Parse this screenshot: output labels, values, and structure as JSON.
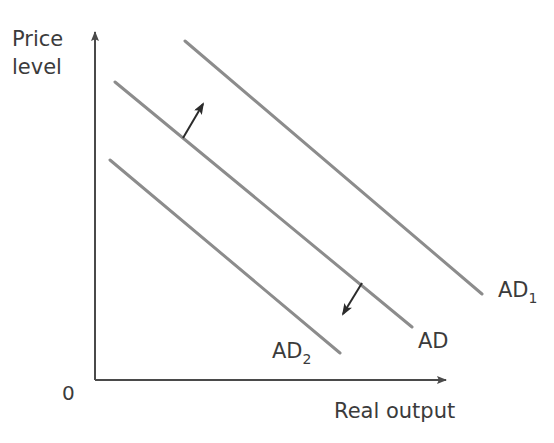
{
  "figure": {
    "background_color": "#ffffff",
    "curve_color": "#8c8c8c",
    "axis_color": "#4a4a4a",
    "text_color": "#3b3b3b"
  },
  "axes": {
    "y_label_line1": "Price",
    "y_label_line2": "level",
    "x_label": "Real output",
    "origin_label": "0"
  },
  "curves": [
    {
      "id": "ad2",
      "label_base": "AD",
      "label_sub": "2",
      "label_full": "AD2",
      "x1": 110,
      "y1": 160,
      "x2": 340,
      "y2": 353,
      "label_x": 272,
      "label_y": 358
    },
    {
      "id": "ad",
      "label_base": "AD",
      "label_sub": "",
      "label_full": "AD",
      "x1": 115,
      "y1": 82,
      "x2": 412,
      "y2": 327,
      "label_x": 418,
      "label_y": 348
    },
    {
      "id": "ad1",
      "label_base": "AD",
      "label_sub": "1",
      "label_full": "AD1",
      "x1": 185,
      "y1": 41,
      "x2": 482,
      "y2": 294,
      "label_x": 498,
      "label_y": 297
    }
  ],
  "arrows": [
    {
      "id": "increase-arrow",
      "direction": "up-right",
      "meaning": "increase in aggregate demand",
      "x1": 183,
      "y1": 138,
      "x2": 203,
      "y2": 104
    },
    {
      "id": "decrease-arrow",
      "direction": "down-left",
      "meaning": "decrease in aggregate demand",
      "x1": 362,
      "y1": 283,
      "x2": 343,
      "y2": 314
    }
  ],
  "chart_data": {
    "type": "line",
    "xlabel": "Real output",
    "ylabel": "Price level",
    "grid": false,
    "legend": "inline-labels",
    "axis_arrows": true,
    "origin_label": "0",
    "xlim": [
      0,
      100
    ],
    "ylim": [
      0,
      100
    ],
    "series": [
      {
        "name": "AD2",
        "description": "Aggregate demand after a decrease (leftward shift)",
        "x": [
          4,
          68
        ],
        "y": [
          66,
          11
        ]
      },
      {
        "name": "AD",
        "description": "Initial aggregate demand",
        "x": [
          6,
          88
        ],
        "y": [
          88,
          19
        ]
      },
      {
        "name": "AD1",
        "description": "Aggregate demand after an increase (rightward shift)",
        "x": [
          25,
          108
        ],
        "y": [
          100,
          28
        ]
      }
    ],
    "annotations": [
      {
        "text": "increase in aggregate demand",
        "symbol": "up-right arrow",
        "from": [
          22,
          72
        ],
        "to": [
          28,
          81
        ]
      },
      {
        "text": "decrease in aggregate demand",
        "symbol": "down-left arrow",
        "from": [
          72,
          28
        ],
        "to": [
          67,
          20
        ]
      }
    ]
  }
}
